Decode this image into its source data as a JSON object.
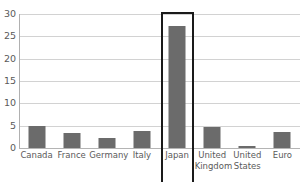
{
  "chart_data": {
    "type": "bar",
    "title": "",
    "subtitle": "",
    "xlabel": "",
    "ylabel": "",
    "categories": [
      "Canada",
      "France",
      "Germany",
      "Italy",
      "Japan",
      "United Kingdom",
      "United States",
      "Euro"
    ],
    "category_lines": [
      [
        "Canada"
      ],
      [
        "France"
      ],
      [
        "Germany"
      ],
      [
        "Italy"
      ],
      [
        "Japan"
      ],
      [
        "United",
        "Kingdom"
      ],
      [
        "United",
        "States"
      ],
      [
        "Euro"
      ]
    ],
    "values": [
      5.0,
      3.3,
      2.2,
      3.8,
      27.4,
      4.8,
      0.4,
      3.5
    ],
    "ylim": [
      0,
      30
    ],
    "yticks": [
      0,
      5,
      10,
      15,
      20,
      25,
      30
    ],
    "ytick_labels": [
      "0",
      "5",
      "10",
      "15",
      "20",
      "25",
      "30"
    ],
    "grid": true,
    "grid_axis": "y",
    "legend": false,
    "legend_position": "none",
    "bar_color": "#6b6b6b",
    "gridline_color": "#d2d2d2",
    "axis_color": "#b0b0b0",
    "text_color": "#5a5a5a",
    "annotations": [
      {
        "name": "japan-highlight",
        "type": "rectangle-outline",
        "target_category": "Japan",
        "color": "#1a1a1a",
        "label": ""
      }
    ]
  }
}
